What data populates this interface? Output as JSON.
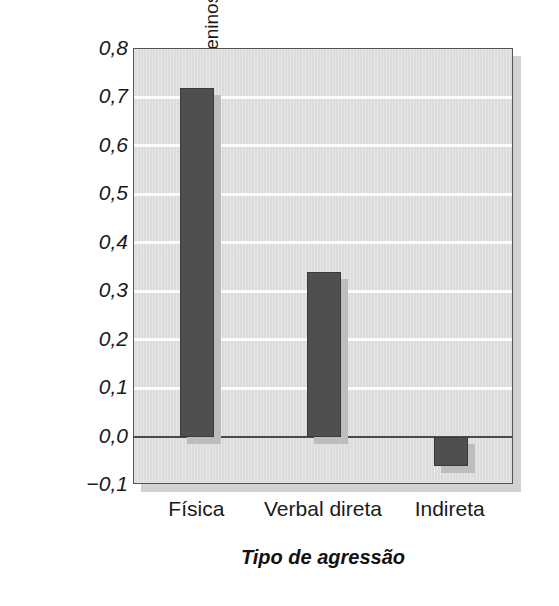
{
  "chart_data": {
    "type": "bar",
    "title": "",
    "xlabel": "Tipo de agressão",
    "ylabel": "Tamanho do efeito (meninos meninas)",
    "categories": [
      "Física",
      "Verbal direta",
      "Indireta"
    ],
    "values": [
      0.72,
      0.34,
      -0.06
    ],
    "ylim": [
      -0.1,
      0.8
    ],
    "ytick_labels": [
      "0,8",
      "0,7",
      "0,6",
      "0,5",
      "0,4",
      "0,3",
      "0,2",
      "0,1",
      "0,0",
      "−0,1"
    ],
    "ytick_values": [
      0.8,
      0.7,
      0.6,
      0.5,
      0.4,
      0.3,
      0.2,
      0.1,
      0.0,
      -0.1
    ],
    "grid": true,
    "legend": false,
    "decimal_separator": ",",
    "colors": {
      "bar_fill": "#4f4f4f",
      "bar_edge": "#3a3a3a",
      "plot_background": "#dcdcdc",
      "gridline": "#fdfdfd",
      "zero_line": "#4a4a4a",
      "axis_border": "#555555",
      "page_background": "#ffffff",
      "text": "#1a1a1a"
    }
  }
}
